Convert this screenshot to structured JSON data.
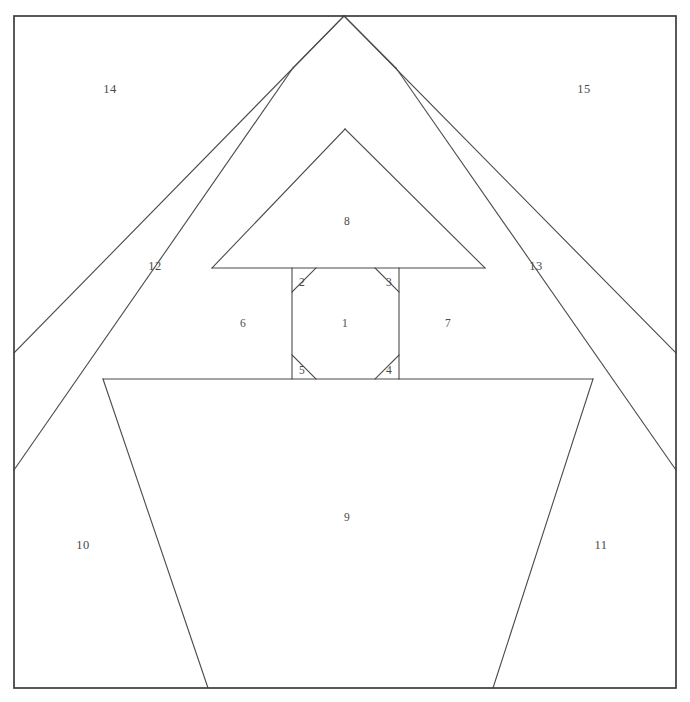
{
  "diagram": {
    "type": "foundation-piecing-numbered-block",
    "canvas": {
      "width": 690,
      "height": 702
    },
    "colors": {
      "background": "#ffffff",
      "seam_line": "#4a4a4a",
      "block_border": "#3d3d3d",
      "label_text": "#4b4b4b"
    },
    "block_border": {
      "name": "block-outline",
      "x": 14,
      "y": 16,
      "width": 662,
      "height": 672
    },
    "patches": [
      {
        "id": "1",
        "label": "1",
        "name": "patch-1-center-octagon",
        "label_x": 345,
        "label_y": 324,
        "points": "292,292 316,268 375,268 399,292 399,355 375,379 316,379 292,355"
      },
      {
        "id": "2",
        "label": "2",
        "name": "patch-2-corner-upper-left",
        "label_x": 302,
        "label_y": 283,
        "points": "292,268 316,268 292,292"
      },
      {
        "id": "3",
        "label": "3",
        "name": "patch-3-corner-upper-right",
        "label_x": 389,
        "label_y": 283,
        "points": "375,268 399,268 399,292"
      },
      {
        "id": "4",
        "label": "4",
        "name": "patch-4-corner-lower-right",
        "label_x": 389,
        "label_y": 371,
        "points": "399,355 399,379 375,379"
      },
      {
        "id": "5",
        "label": "5",
        "name": "patch-5-corner-lower-left",
        "label_x": 302,
        "label_y": 371,
        "points": "292,355 292,379 316,379"
      },
      {
        "id": "6",
        "label": "6",
        "name": "patch-6-left-wall",
        "label_x": 243,
        "label_y": 324,
        "points": "212,268 292,268 292,379 212,379"
      },
      {
        "id": "7",
        "label": "7",
        "name": "patch-7-right-wall",
        "label_x": 448,
        "label_y": 324,
        "points": "399,268 485,268 485,379 399,379"
      },
      {
        "id": "8",
        "label": "8",
        "name": "patch-8-inner-gable",
        "label_x": 347,
        "label_y": 222,
        "points": "345,129 485,268 212,268"
      },
      {
        "id": "9",
        "label": "9",
        "name": "patch-9-house-front",
        "label_x": 347,
        "label_y": 518,
        "points": "103,379 593,379 493,688 208,688"
      },
      {
        "id": "10",
        "label": "10",
        "name": "patch-10-lower-left-corner",
        "label_x": 83,
        "label_y": 546,
        "points": "14,470 103,379 208,688 14,688"
      },
      {
        "id": "11",
        "label": "11",
        "name": "patch-11-lower-right-corner",
        "label_x": 601,
        "label_y": 546,
        "points": "593,379 676,470 676,688 493,688"
      },
      {
        "id": "12",
        "label": "12",
        "name": "patch-12-left-roof-band",
        "label_x": 155,
        "label_y": 267,
        "points": "293,68 212,268 103,379 14,470 14,353"
      },
      {
        "id": "13",
        "label": "13",
        "name": "patch-13-right-roof-band",
        "label_x": 536,
        "label_y": 267,
        "points": "396,68 676,353 676,470 593,379 485,268"
      },
      {
        "id": "14",
        "label": "14",
        "name": "patch-14-upper-left-sky",
        "label_x": 110,
        "label_y": 90,
        "points": "14,16 344,16 293,68 14,353"
      },
      {
        "id": "15",
        "label": "15",
        "name": "patch-15-upper-right-sky",
        "label_x": 584,
        "label_y": 90,
        "points": "344,16 676,16 676,353 396,68"
      }
    ],
    "seam_paths": [
      {
        "name": "roof-ridge-left-outer",
        "d": "M 14,353 L 344,16"
      },
      {
        "name": "roof-ridge-right-outer",
        "d": "M 344,16 L 676,353"
      },
      {
        "name": "roof-ridge-left-inner",
        "d": "M 14,470 L 293,68"
      },
      {
        "name": "roof-ridge-right-inner",
        "d": "M 396,68 L 676,470"
      },
      {
        "name": "roof-apex-left-notch",
        "d": "M 293,68 L 344,16"
      },
      {
        "name": "roof-apex-right-notch",
        "d": "M 344,16 L 396,68"
      },
      {
        "name": "gable-left-edge",
        "d": "M 345,129 L 212,268"
      },
      {
        "name": "gable-right-edge",
        "d": "M 345,129 L 485,268"
      },
      {
        "name": "wall-top-rail",
        "d": "M 212,268 L 485,268"
      },
      {
        "name": "eaves-rail",
        "d": "M 103,379 L 593,379"
      },
      {
        "name": "center-left-stile",
        "d": "M 292,268 L 292,379"
      },
      {
        "name": "center-right-stile",
        "d": "M 399,268 L 399,379"
      },
      {
        "name": "octagon-bevel-top-left",
        "d": "M 292,292 L 316,268"
      },
      {
        "name": "octagon-bevel-top-right",
        "d": "M 375,268 L 399,292"
      },
      {
        "name": "octagon-bevel-bot-right",
        "d": "M 399,355 L 375,379"
      },
      {
        "name": "octagon-bevel-bot-left",
        "d": "M 292,355 L 316,379"
      },
      {
        "name": "front-left-slope",
        "d": "M 103,379 L 208,688"
      },
      {
        "name": "front-right-slope",
        "d": "M 593,379 L 493,688"
      }
    ]
  }
}
